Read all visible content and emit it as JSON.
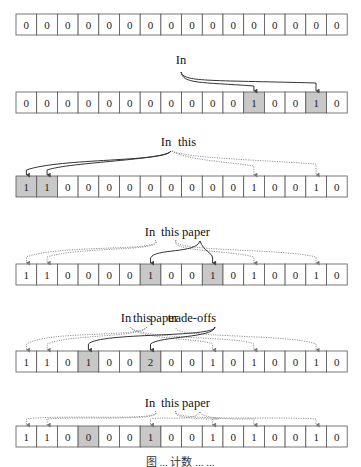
{
  "diagram": {
    "grid": {
      "x0": 16,
      "cell_w": 20.7,
      "cell_h": 21,
      "cells": 16
    },
    "colors": {
      "shade": "#c8c8c8",
      "border": "#555555",
      "arc_solid": "#333333",
      "arc_dotted": "#888888"
    },
    "rows": [
      {
        "y": 14,
        "values": [
          0,
          0,
          0,
          0,
          0,
          0,
          0,
          0,
          0,
          0,
          0,
          0,
          0,
          0,
          0,
          0
        ],
        "shaded": [],
        "words": []
      },
      {
        "y": 92,
        "values": [
          0,
          0,
          0,
          0,
          0,
          0,
          0,
          0,
          0,
          0,
          0,
          1,
          0,
          0,
          1,
          0
        ],
        "shaded": [
          11,
          14
        ],
        "words": [
          {
            "text": "In",
            "x": 181,
            "y": 64
          }
        ]
      },
      {
        "y": 176,
        "values": [
          1,
          1,
          0,
          0,
          0,
          0,
          0,
          0,
          0,
          0,
          0,
          1,
          0,
          0,
          1,
          0
        ],
        "shaded": [
          0,
          1
        ],
        "words": [
          {
            "text": "In",
            "x": 166,
            "y": 146
          },
          {
            "text": "this",
            "x": 187,
            "y": 146
          }
        ]
      },
      {
        "y": 264,
        "values": [
          1,
          1,
          0,
          0,
          0,
          0,
          1,
          0,
          0,
          1,
          0,
          1,
          0,
          0,
          1,
          0
        ],
        "shaded": [
          6,
          9
        ],
        "words": [
          {
            "text": "In",
            "x": 150,
            "y": 236
          },
          {
            "text": "this",
            "x": 170,
            "y": 236
          },
          {
            "text": "paper",
            "x": 196,
            "y": 236
          }
        ]
      },
      {
        "y": 351,
        "values": [
          1,
          1,
          0,
          1,
          0,
          0,
          2,
          0,
          0,
          1,
          0,
          1,
          0,
          0,
          1,
          0
        ],
        "shaded": [
          3,
          6
        ],
        "words": [
          {
            "text": "In",
            "x": 126,
            "y": 322
          },
          {
            "text": "this",
            "x": 142,
            "y": 322
          },
          {
            "text": "paper",
            "x": 164,
            "y": 322
          },
          {
            "text": "trade-offs",
            "x": 192,
            "y": 322
          }
        ]
      },
      {
        "y": 426,
        "values": [
          1,
          1,
          0,
          0,
          0,
          0,
          1,
          0,
          0,
          1,
          0,
          1,
          0,
          0,
          1,
          0
        ],
        "shaded": [
          3,
          6
        ],
        "words": [
          {
            "text": "In",
            "x": 150,
            "y": 407
          },
          {
            "text": "this",
            "x": 170,
            "y": 407
          },
          {
            "text": "paper",
            "x": 196,
            "y": 407
          }
        ]
      }
    ],
    "caption": "图 ... 计数 ... ..."
  }
}
